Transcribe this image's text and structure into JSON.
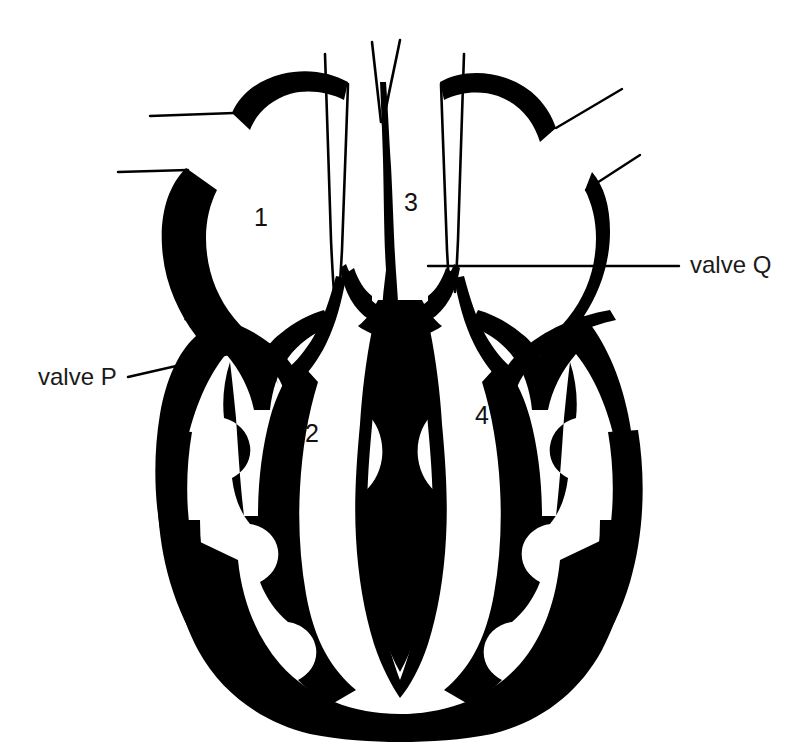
{
  "figure": {
    "kind": "anatomical-line-diagram",
    "background_color": "#ffffff",
    "ink_color": "#000000",
    "text_color": "#1a1a1a",
    "width": 789,
    "height": 744
  },
  "chamber_labels": [
    {
      "id": "1",
      "text": "1",
      "x": 263,
      "y": 218
    },
    {
      "id": "2",
      "text": "2",
      "x": 313,
      "y": 435
    },
    {
      "id": "3",
      "text": "3",
      "x": 412,
      "y": 203
    },
    {
      "id": "4",
      "text": "4",
      "x": 484,
      "y": 416
    }
  ],
  "valve_labels": [
    {
      "id": "valve-p",
      "text": "valve P",
      "x": 38,
      "y": 363,
      "leader": "diagonal-up-right"
    },
    {
      "id": "valve-q",
      "text": "valve Q",
      "x": 690,
      "y": 251,
      "leader": "horizontal-left"
    }
  ],
  "leader_lines": [
    {
      "id": "leader-vessel-top-left",
      "from": [
        150,
        116
      ],
      "to": [
        232,
        113
      ]
    },
    {
      "id": "leader-vessel-mid-left",
      "from": [
        118,
        172
      ],
      "to": [
        186,
        170
      ]
    },
    {
      "id": "leader-vessel-top-right",
      "from": [
        622,
        89
      ],
      "to": [
        556,
        128
      ]
    },
    {
      "id": "leader-vessel-mid-right",
      "from": [
        640,
        155
      ],
      "to": [
        585,
        190
      ]
    },
    {
      "id": "leader-valve-p",
      "from": [
        128,
        377
      ],
      "to": [
        272,
        344
      ]
    },
    {
      "id": "leader-valve-q",
      "from": [
        428,
        266
      ],
      "to": [
        679,
        266
      ]
    }
  ]
}
